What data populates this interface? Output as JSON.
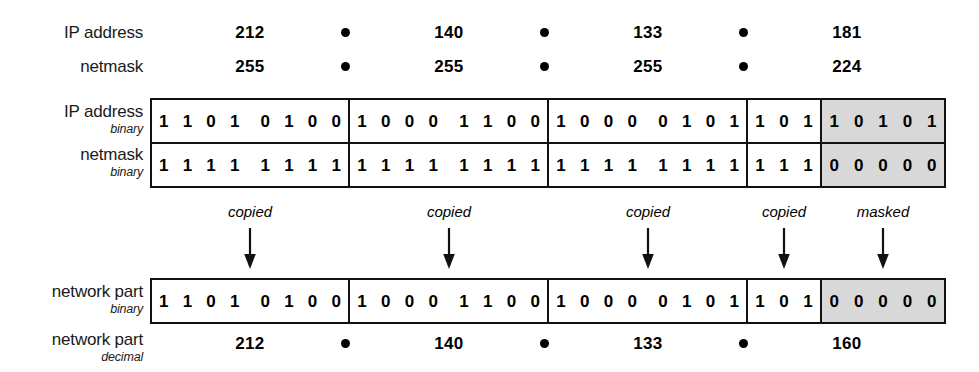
{
  "diagram": {
    "colors": {
      "ink": "#111111",
      "masked_fill": "#d8d8d8",
      "page_bg": "#ffffff"
    },
    "rows": {
      "ip_decimal_label": "IP address",
      "netmask_decimal_label": "netmask",
      "ip_binary_label": "IP address",
      "ip_binary_sublabel": "binary",
      "netmask_binary_label": "netmask",
      "netmask_binary_sublabel": "binary",
      "network_binary_label": "network part",
      "network_binary_sublabel": "binary",
      "network_decimal_label": "network part",
      "network_decimal_sublabel": "decimal"
    },
    "separator_glyph": "dot",
    "ip_decimal": [
      "212",
      "140",
      "133",
      "181"
    ],
    "netmask_decimal": [
      "255",
      "255",
      "255",
      "224"
    ],
    "network_decimal": [
      "212",
      "140",
      "133",
      "160"
    ],
    "ip_binary": {
      "octet1": [
        "1",
        "1",
        "0",
        "1",
        "0",
        "1",
        "0",
        "0"
      ],
      "octet2": [
        "1",
        "0",
        "0",
        "0",
        "1",
        "1",
        "0",
        "0"
      ],
      "octet3": [
        "1",
        "0",
        "0",
        "0",
        "0",
        "1",
        "0",
        "1"
      ],
      "octet4_network_bits": [
        "1",
        "0",
        "1"
      ],
      "octet4_host_bits": [
        "1",
        "0",
        "1",
        "0",
        "1"
      ]
    },
    "netmask_binary": {
      "octet1": [
        "1",
        "1",
        "1",
        "1",
        "1",
        "1",
        "1",
        "1"
      ],
      "octet2": [
        "1",
        "1",
        "1",
        "1",
        "1",
        "1",
        "1",
        "1"
      ],
      "octet3": [
        "1",
        "1",
        "1",
        "1",
        "1",
        "1",
        "1",
        "1"
      ],
      "octet4_network_bits": [
        "1",
        "1",
        "1"
      ],
      "octet4_host_bits": [
        "0",
        "0",
        "0",
        "0",
        "0"
      ]
    },
    "network_binary": {
      "octet1": [
        "1",
        "1",
        "0",
        "1",
        "0",
        "1",
        "0",
        "0"
      ],
      "octet2": [
        "1",
        "0",
        "0",
        "0",
        "1",
        "1",
        "0",
        "0"
      ],
      "octet3": [
        "1",
        "0",
        "0",
        "0",
        "0",
        "1",
        "0",
        "1"
      ],
      "octet4_network_bits": [
        "1",
        "0",
        "1"
      ],
      "octet4_host_bits": [
        "0",
        "0",
        "0",
        "0",
        "0"
      ]
    },
    "annotations": [
      {
        "label": "copied"
      },
      {
        "label": "copied"
      },
      {
        "label": "copied"
      },
      {
        "label": "copied"
      },
      {
        "label": "masked"
      }
    ]
  }
}
